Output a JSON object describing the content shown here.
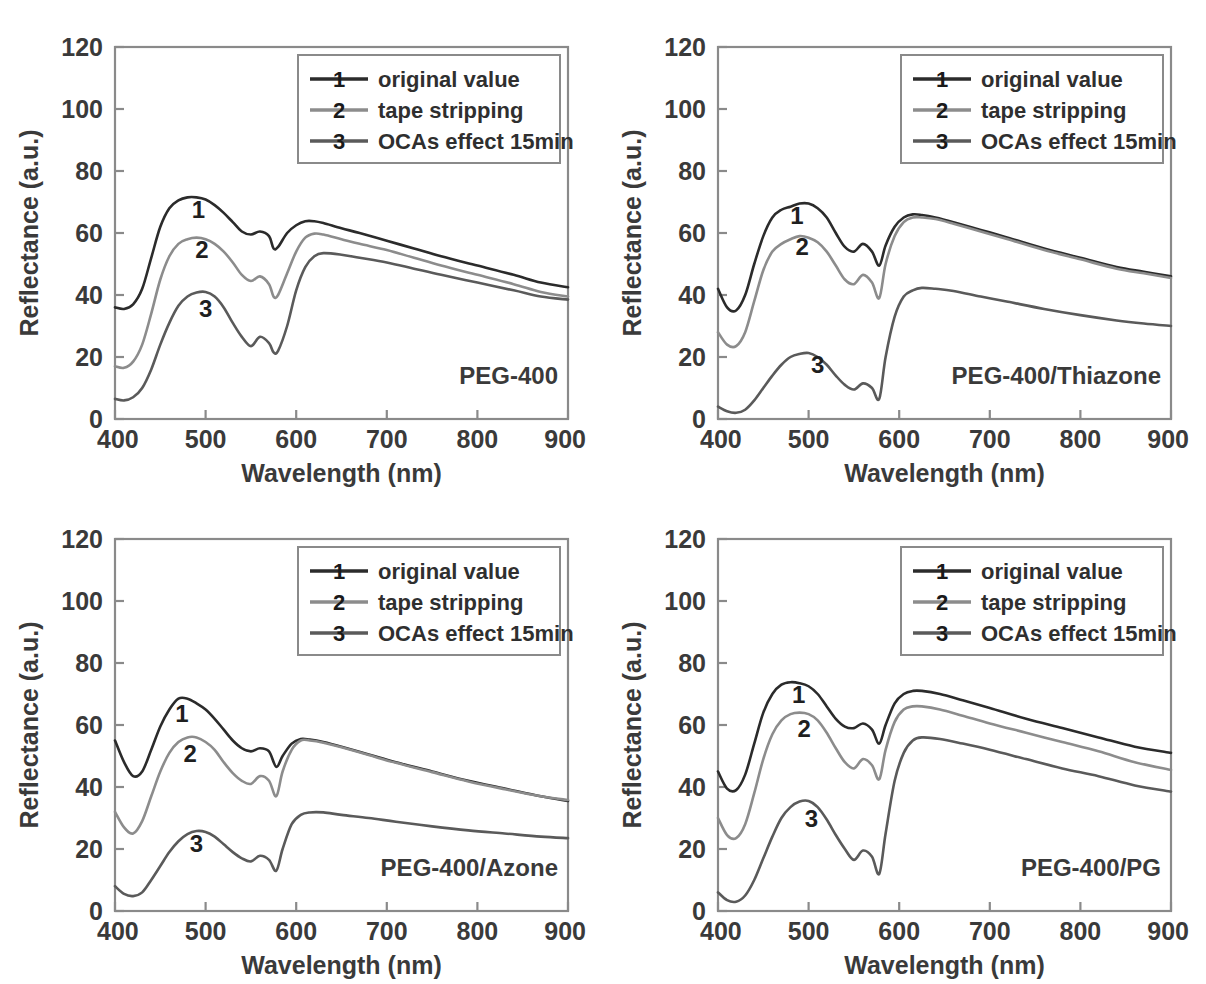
{
  "figure": {
    "background_color": "#ffffff",
    "panel_count": 4
  },
  "axes": {
    "xlabel": "Wavelength (nm)",
    "ylabel": "Reflectance (a.u.)",
    "xticks": [
      400,
      500,
      600,
      700,
      800,
      900
    ],
    "xtick_labels": [
      "400",
      "500",
      "600",
      "700",
      "800",
      "900"
    ],
    "yticks": [
      0,
      20,
      40,
      60,
      80,
      100,
      120
    ],
    "ytick_labels": [
      "0",
      "20",
      "40",
      "60",
      "80",
      "100",
      "120"
    ],
    "xlim": [
      400,
      900
    ],
    "ylim": [
      0,
      120
    ],
    "grid": false
  },
  "legend": {
    "position": "top-right-inside",
    "entries": [
      {
        "marker": "1",
        "label": "original value",
        "color": "#2b2b2b"
      },
      {
        "marker": "2",
        "label": "tape stripping",
        "color": "#8c8c8c"
      },
      {
        "marker": "3",
        "label": "OCAs effect 15min",
        "color": "#5a5a5a"
      }
    ]
  },
  "colors": {
    "series1": "#2b2b2b",
    "series2": "#8c8c8c",
    "series3": "#5a5a5a",
    "frame": "#8a8a8a",
    "text": "#3a3a3a"
  },
  "chart_data": [
    {
      "type": "line",
      "panel_index": 0,
      "panel_position": "top-left",
      "annotation": "PEG-400",
      "title": "PEG-400",
      "xlabel": "Wavelength (nm)",
      "ylabel": "Reflectance (a.u.)",
      "xlim": [
        400,
        900
      ],
      "ylim": [
        0,
        120
      ],
      "xticks": [
        400,
        500,
        600,
        700,
        800,
        900
      ],
      "yticks": [
        0,
        20,
        40,
        60,
        80,
        100,
        120
      ],
      "grid": false,
      "x": [
        400,
        410,
        420,
        430,
        440,
        450,
        460,
        470,
        480,
        490,
        500,
        510,
        520,
        530,
        540,
        550,
        560,
        570,
        575,
        580,
        590,
        600,
        610,
        620,
        630,
        650,
        670,
        700,
        730,
        760,
        800,
        840,
        870,
        900
      ],
      "series": [
        {
          "name": "original value",
          "marker": "1",
          "color": "#2b2b2b",
          "label_at": {
            "x": 492,
            "y": 65
          },
          "values": [
            36,
            35.5,
            37,
            42,
            52,
            62,
            68,
            70.5,
            71.5,
            71.5,
            70.8,
            69,
            66.5,
            63.5,
            60.5,
            59.5,
            60.5,
            59,
            55,
            55.5,
            60,
            62.5,
            63.8,
            63.8,
            63.2,
            61.5,
            60,
            57.5,
            55,
            52.5,
            49.5,
            46.5,
            44,
            42.5
          ]
        },
        {
          "name": "tape stripping",
          "marker": "2",
          "color": "#8c8c8c",
          "label_at": {
            "x": 496,
            "y": 52
          },
          "values": [
            17,
            16.5,
            18.5,
            24,
            34,
            45,
            52.5,
            56.5,
            58,
            58.5,
            58,
            56.5,
            54,
            50.5,
            46.5,
            44.5,
            46,
            43.5,
            39.5,
            40,
            47,
            54,
            58.5,
            59.8,
            59.5,
            58,
            56.5,
            54.5,
            52,
            49.5,
            46.5,
            43.5,
            41,
            39.5
          ]
        },
        {
          "name": "OCAs effect 15min",
          "marker": "3",
          "color": "#5a5a5a",
          "label_at": {
            "x": 500,
            "y": 33
          },
          "values": [
            6.5,
            6,
            7,
            10,
            16,
            24,
            31,
            36.5,
            39.5,
            40.8,
            41,
            39.5,
            36,
            31,
            26.5,
            23.5,
            26.5,
            24.5,
            21.5,
            22,
            30,
            41.5,
            49,
            52.5,
            53.5,
            53,
            52,
            50.5,
            48.5,
            46.5,
            44,
            41.5,
            39.5,
            38.5
          ]
        }
      ]
    },
    {
      "type": "line",
      "panel_index": 1,
      "panel_position": "top-right",
      "annotation": "PEG-400/Thiazone",
      "title": "PEG-400/Thiazone",
      "xlabel": "Wavelength (nm)",
      "ylabel": "Reflectance (a.u.)",
      "xlim": [
        400,
        900
      ],
      "ylim": [
        0,
        120
      ],
      "xticks": [
        400,
        500,
        600,
        700,
        800,
        900
      ],
      "yticks": [
        0,
        20,
        40,
        60,
        80,
        100,
        120
      ],
      "grid": false,
      "x": [
        400,
        410,
        420,
        430,
        440,
        450,
        460,
        470,
        480,
        490,
        500,
        510,
        520,
        530,
        540,
        550,
        560,
        570,
        578,
        585,
        595,
        605,
        615,
        625,
        640,
        660,
        690,
        720,
        760,
        800,
        840,
        870,
        900
      ],
      "series": [
        {
          "name": "original value",
          "marker": "1",
          "color": "#2b2b2b",
          "label_at": {
            "x": 487,
            "y": 63
          },
          "values": [
            42,
            36,
            35,
            40,
            50,
            59,
            65,
            67.5,
            68.5,
            69.5,
            69.5,
            68,
            65,
            60,
            55.5,
            54,
            56.5,
            54,
            49.5,
            56,
            62,
            65,
            66,
            65.8,
            65,
            63.5,
            61,
            58.5,
            55,
            52,
            49,
            47.5,
            46
          ]
        },
        {
          "name": "tape stripping",
          "marker": "2",
          "color": "#8c8c8c",
          "label_at": {
            "x": 493,
            "y": 53
          },
          "values": [
            28,
            24,
            23.5,
            28,
            38,
            48,
            54,
            56.5,
            58,
            59,
            58.5,
            57,
            54,
            49.5,
            45,
            43.5,
            46.5,
            44,
            39,
            50,
            59,
            63.5,
            65,
            65,
            64.5,
            63,
            60.5,
            58,
            54.5,
            51.5,
            48.5,
            47,
            45.5
          ]
        },
        {
          "name": "OCAs effect 15min",
          "marker": "3",
          "color": "#5a5a5a",
          "label_at": {
            "x": 510,
            "y": 15
          },
          "values": [
            4,
            2.5,
            2,
            3,
            6,
            10,
            14,
            17.5,
            20,
            21,
            21.3,
            20,
            17.5,
            14,
            11,
            9.5,
            11.5,
            10,
            6.5,
            20,
            33,
            39.5,
            41.5,
            42.3,
            42,
            41.3,
            39.5,
            37.8,
            35.5,
            33.5,
            31.8,
            30.8,
            30
          ]
        }
      ]
    },
    {
      "type": "line",
      "panel_index": 2,
      "panel_position": "bottom-left",
      "annotation": "PEG-400/Azone",
      "title": "PEG-400/Azone",
      "xlabel": "Wavelength (nm)",
      "ylabel": "Reflectance (a.u.)",
      "xlim": [
        400,
        900
      ],
      "ylim": [
        0,
        120
      ],
      "xticks": [
        400,
        500,
        600,
        700,
        800,
        900
      ],
      "yticks": [
        0,
        20,
        40,
        60,
        80,
        100,
        120
      ],
      "grid": false,
      "x": [
        400,
        410,
        420,
        430,
        440,
        450,
        460,
        470,
        480,
        490,
        500,
        510,
        520,
        530,
        540,
        550,
        560,
        570,
        578,
        585,
        595,
        605,
        615,
        630,
        650,
        680,
        710,
        750,
        790,
        830,
        870,
        900
      ],
      "series": [
        {
          "name": "original value",
          "marker": "1",
          "color": "#2b2b2b",
          "label_at": {
            "x": 474,
            "y": 61
          },
          "values": [
            55,
            48,
            43.5,
            45,
            52,
            59.5,
            65,
            68.5,
            68.5,
            67,
            65,
            62,
            58.5,
            55,
            52.5,
            51.5,
            52.5,
            51.5,
            46.5,
            50,
            54,
            55.5,
            55.3,
            54.5,
            53,
            50.5,
            48,
            45,
            42,
            39.5,
            37,
            35.5
          ]
        },
        {
          "name": "tape stripping",
          "marker": "2",
          "color": "#8c8c8c",
          "label_at": {
            "x": 483,
            "y": 48
          },
          "values": [
            32,
            27,
            25,
            29,
            37,
            45,
            51,
            54.5,
            56,
            56,
            54.5,
            52,
            48,
            44.5,
            42,
            41,
            43.5,
            42,
            37,
            45,
            52,
            55,
            55,
            54.3,
            52.8,
            50.3,
            47.8,
            44.8,
            41.8,
            39.3,
            37,
            35.8
          ]
        },
        {
          "name": "OCAs effect 15min",
          "marker": "3",
          "color": "#5a5a5a",
          "label_at": {
            "x": 490,
            "y": 19
          },
          "values": [
            8,
            5.5,
            4.8,
            6,
            10,
            14.5,
            19,
            22.5,
            24.8,
            25.8,
            25.5,
            24,
            21.5,
            19,
            17,
            16,
            17.8,
            16.5,
            13,
            20,
            28,
            31,
            31.8,
            31.8,
            31,
            30,
            28.8,
            27.3,
            26,
            25,
            24,
            23.5
          ]
        }
      ]
    },
    {
      "type": "line",
      "panel_index": 3,
      "panel_position": "bottom-right",
      "annotation": "PEG-400/PG",
      "title": "PEG-400/PG",
      "xlabel": "Wavelength (nm)",
      "ylabel": "Reflectance (a.u.)",
      "xlim": [
        400,
        900
      ],
      "ylim": [
        0,
        120
      ],
      "xticks": [
        400,
        500,
        600,
        700,
        800,
        900
      ],
      "yticks": [
        0,
        20,
        40,
        60,
        80,
        100,
        120
      ],
      "grid": false,
      "x": [
        400,
        410,
        420,
        430,
        440,
        450,
        460,
        470,
        480,
        490,
        500,
        510,
        520,
        530,
        540,
        550,
        560,
        570,
        578,
        585,
        595,
        605,
        615,
        625,
        645,
        670,
        700,
        740,
        780,
        820,
        860,
        900
      ],
      "series": [
        {
          "name": "original value",
          "marker": "1",
          "color": "#2b2b2b",
          "label_at": {
            "x": 489,
            "y": 67
          },
          "values": [
            45,
            39.5,
            39,
            44,
            54,
            64,
            70,
            73,
            73.8,
            73.5,
            72.5,
            70,
            66,
            62,
            59.5,
            59,
            60.5,
            58.5,
            54,
            60,
            67,
            70,
            71,
            71,
            70,
            68,
            65.5,
            62,
            59,
            56,
            53,
            51
          ]
        },
        {
          "name": "tape stripping",
          "marker": "2",
          "color": "#8c8c8c",
          "label_at": {
            "x": 495,
            "y": 56
          },
          "values": [
            30,
            24.5,
            23.5,
            28,
            38,
            49,
            57,
            61.5,
            63.5,
            64,
            63.5,
            61.5,
            57.5,
            52.5,
            48,
            46,
            49,
            47,
            42.5,
            52,
            61,
            65,
            66,
            66,
            65,
            63,
            60.5,
            57.5,
            54.5,
            51.5,
            48,
            45.5
          ]
        },
        {
          "name": "OCAs effect 15min",
          "marker": "3",
          "color": "#5a5a5a",
          "label_at": {
            "x": 503,
            "y": 27
          },
          "values": [
            6,
            3.5,
            3,
            5,
            10,
            17,
            24,
            30,
            33.5,
            35.3,
            35.5,
            33.5,
            29.5,
            24.5,
            20,
            16.5,
            19.5,
            17.5,
            12,
            25,
            42,
            51,
            55,
            56,
            55.5,
            54,
            52,
            49,
            46,
            43.5,
            40.5,
            38.5
          ]
        }
      ]
    }
  ]
}
